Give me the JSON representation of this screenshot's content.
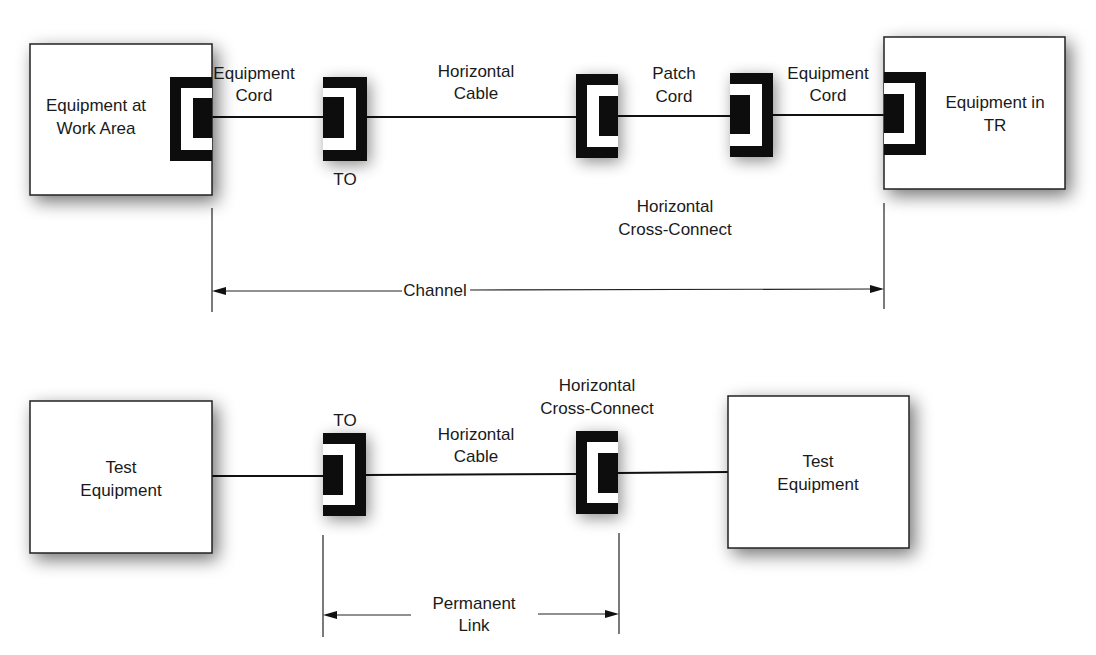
{
  "channel_diagram": {
    "equipment_work_area": {
      "line1": "Equipment at",
      "line2": "Work Area"
    },
    "equipment_cord_left": {
      "line1": "Equipment",
      "line2": "Cord"
    },
    "to_label": "TO",
    "horizontal_cable": {
      "line1": "Horizontal",
      "line2": "Cable"
    },
    "patch_cord": {
      "line1": "Patch",
      "line2": "Cord"
    },
    "equipment_cord_right": {
      "line1": "Equipment",
      "line2": "Cord"
    },
    "equipment_tr": {
      "line1": "Equipment in",
      "line2": "TR"
    },
    "horizontal_cross_connect": {
      "line1": "Horizontal",
      "line2": "Cross-Connect"
    },
    "span_label": "Channel"
  },
  "permanent_link_diagram": {
    "test_equipment_left": {
      "line1": "Test",
      "line2": "Equipment"
    },
    "to_label": "TO",
    "horizontal_cable": {
      "line1": "Horizontal",
      "line2": "Cable"
    },
    "horizontal_cross_connect": {
      "line1": "Horizontal",
      "line2": "Cross-Connect"
    },
    "test_equipment_right": {
      "line1": "Test",
      "line2": "Equipment"
    },
    "span_label": {
      "line1": "Permanent",
      "line2": "Link"
    }
  },
  "colors": {
    "ink": "#111111",
    "box_fill": "#ffffff",
    "shadow": "#8a8a8a"
  }
}
